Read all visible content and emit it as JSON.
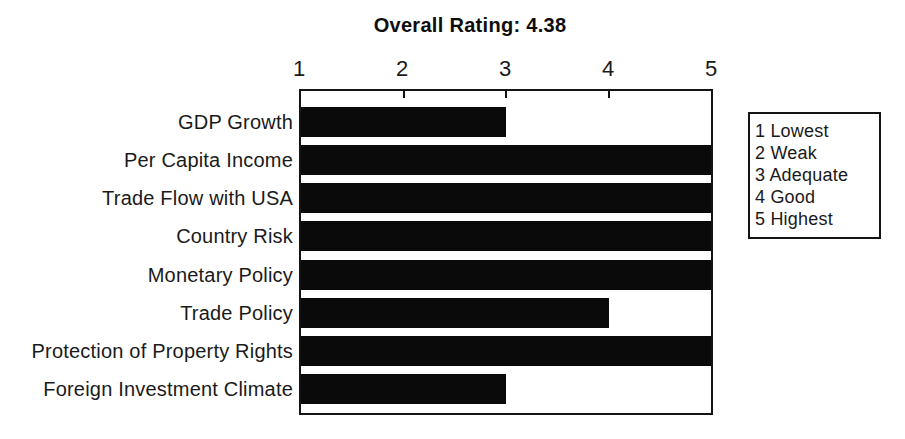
{
  "title": "Overall Rating: 4.38",
  "chart_data": {
    "type": "bar",
    "orientation": "horizontal",
    "title": "Overall Rating: 4.38",
    "categories": [
      "GDP Growth",
      "Per Capita Income",
      "Trade Flow with USA",
      "Country Risk",
      "Monetary Policy",
      "Trade Policy",
      "Protection of Property Rights",
      "Foreign Investment Climate"
    ],
    "values": [
      3,
      5,
      5,
      5,
      5,
      4,
      5,
      3
    ],
    "xlabel": "",
    "ylabel": "",
    "xlim": [
      1,
      5
    ],
    "x_ticks": [
      1,
      2,
      3,
      4,
      5
    ],
    "grid": false,
    "bar_color": "#0a0a0a",
    "legend_position": "right",
    "legend_entries": [
      "1 Lowest",
      "2 Weak",
      "3 Adequate",
      "4 Good",
      "5 Highest"
    ]
  },
  "legend": {
    "items": [
      "1 Lowest",
      "2 Weak",
      "3 Adequate",
      "4 Good",
      "5 Highest"
    ]
  }
}
